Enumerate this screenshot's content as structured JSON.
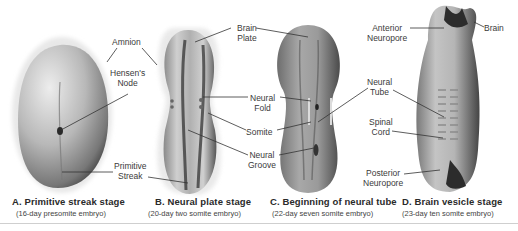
{
  "figure": {
    "panels": [
      {
        "id": "A",
        "title": "A. Primitive streak stage",
        "subtitle": "(16-day presomite embryo)"
      },
      {
        "id": "B",
        "title": "B. Neural plate stage",
        "subtitle": "(20-day two somite embryo)"
      },
      {
        "id": "C",
        "title": "C. Beginning of neural tube",
        "subtitle": "(22-day seven somite embryo)"
      },
      {
        "id": "D",
        "title": "D. Brain vesicle stage",
        "subtitle": "(23-day ten somite embryo)"
      }
    ],
    "labels": {
      "amnion": "Amnion",
      "hensens_node_1": "Hensen's",
      "hensens_node_2": "Node",
      "primitive_streak_1": "Primitive",
      "primitive_streak_2": "Streak",
      "brain_plate_1": "Brain",
      "brain_plate_2": "Plate",
      "neural_fold_1": "Neural",
      "neural_fold_2": "Fold",
      "somite": "Somite",
      "neural_groove_1": "Neural",
      "neural_groove_2": "Groove",
      "anterior_neuropore_1": "Anterior",
      "anterior_neuropore_2": "Neuropore",
      "brain": "Brain",
      "neural_tube_1": "Neural",
      "neural_tube_2": "Tube",
      "spinal_cord_1": "Spinal",
      "spinal_cord_2": "Cord",
      "posterior_neuropore_1": "Posterior",
      "posterior_neuropore_2": "Neuropore"
    },
    "colors": {
      "embryo_light": "#d8d8d8",
      "embryo_mid": "#9a9a9a",
      "embryo_dark": "#3c3c3c",
      "leader_line": "#333333"
    }
  }
}
